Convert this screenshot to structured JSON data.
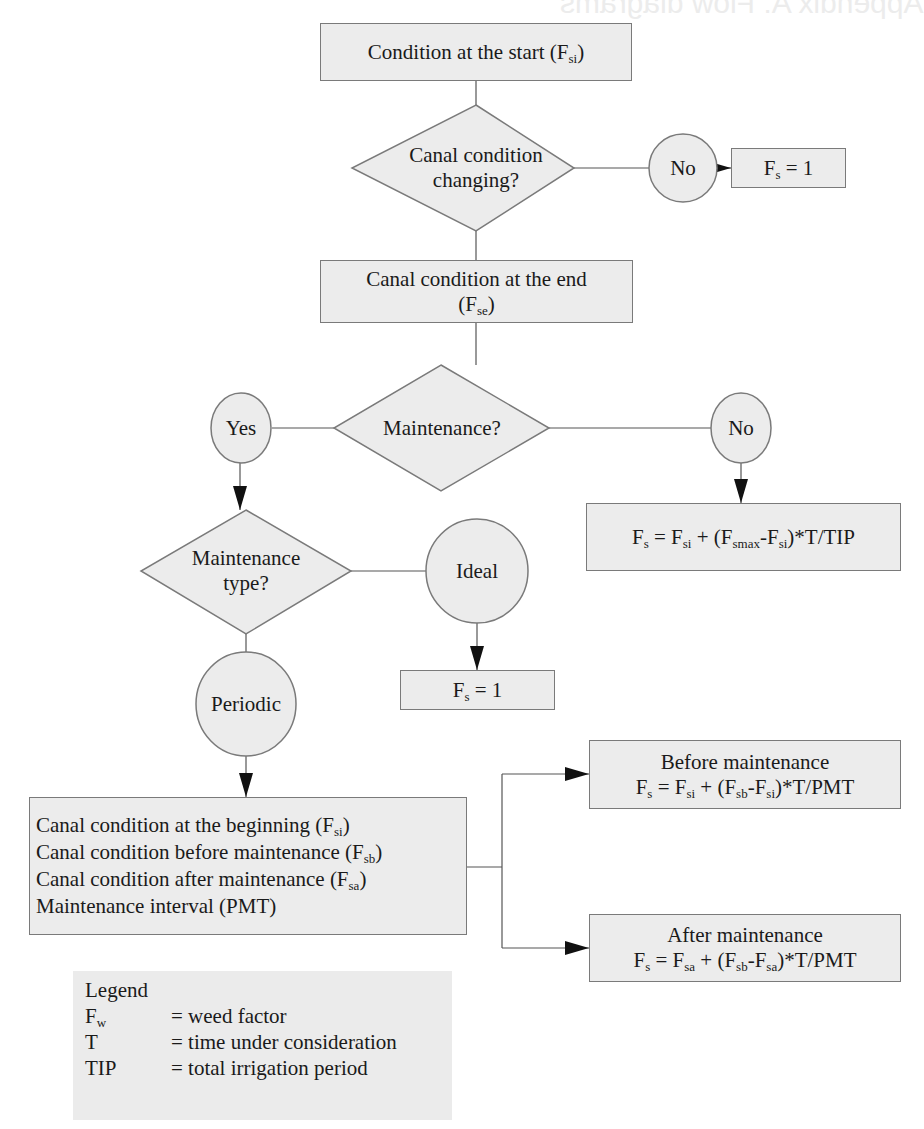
{
  "page": {
    "ghost_header": "Appendix A: Flow diagrams"
  },
  "nodes": {
    "start": {
      "text": "Condition at the start (F",
      "sub": "si",
      "close": ")"
    },
    "decision_changing": {
      "line1": "Canal condition",
      "line2": "changing?"
    },
    "no_changing": {
      "text": "No"
    },
    "fs_one_top": {
      "text": "F",
      "sub": "s",
      "rest": " = 1"
    },
    "end_condition": {
      "line1": "Canal condition at the end",
      "line2_open": "(F",
      "line2_sub": "se",
      "line2_close": ")"
    },
    "decision_maintenance": {
      "text": "Maintenance?"
    },
    "yes": {
      "text": "Yes"
    },
    "no_maintenance": {
      "text": "No"
    },
    "formula_no_maint": {
      "p1": "F",
      "s1": "s",
      "p2": " = F",
      "s2": "si",
      "p3": " + (F",
      "s3": "smax",
      "p4": "-F",
      "s4": "si",
      "p5": ")*T/TIP"
    },
    "decision_type": {
      "line1": "Maintenance",
      "line2": "type?"
    },
    "ideal": {
      "text": "Ideal"
    },
    "fs_one_ideal": {
      "text": "F",
      "sub": "s",
      "rest": " = 1"
    },
    "periodic": {
      "text": "Periodic"
    },
    "inputs": {
      "lines": [
        {
          "text": "Canal condition at the beginning (F",
          "sub": "si",
          "close": ")"
        },
        {
          "text": "Canal condition before maintenance (F",
          "sub": "sb",
          "close": ")"
        },
        {
          "text": "Canal condition after maintenance (F",
          "sub": "sa",
          "close": ")"
        },
        {
          "text": "Maintenance interval (PMT)",
          "sub": "",
          "close": ""
        }
      ]
    },
    "before": {
      "title": "Before maintenance",
      "p1": "F",
      "s1": "s",
      "p2": " = F",
      "s2": "si",
      "p3": " + (F",
      "s3": "sb",
      "p4": "-F",
      "s4": "si",
      "p5": ")*T/PMT"
    },
    "after": {
      "title": "After maintenance",
      "p1": "F",
      "s1": "s",
      "p2": " = F",
      "s2": "sa",
      "p3": " + (F",
      "s3": "sb",
      "p4": "-F",
      "s4": "sa",
      "p5": ")*T/PMT"
    }
  },
  "legend": {
    "title": "Legend",
    "items": [
      {
        "key": "F",
        "key_sub": "w",
        "value": "= weed factor"
      },
      {
        "key": "T",
        "key_sub": "",
        "value": "= time under consideration"
      },
      {
        "key": "TIP",
        "key_sub": "",
        "value": "= total irrigation period"
      }
    ]
  },
  "colors": {
    "fill": "#ececec",
    "stroke": "#7a7a7a",
    "line": "#555555",
    "arrow": "#111111"
  }
}
